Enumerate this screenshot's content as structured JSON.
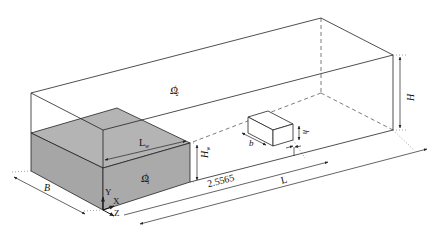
{
  "diagram": {
    "type": "3d-domain-schematic",
    "colors": {
      "line": "#222222",
      "block_fill": "#a9a9a9",
      "block_top": "#b4b4b4",
      "background": "#ffffff"
    },
    "regions": {
      "fluid_upper": {
        "symbol": "Ω",
        "sub": "2",
        "sup": "f"
      },
      "fluid_lower": {
        "symbol": "Ω",
        "sub": "1",
        "sup": "f"
      }
    },
    "dimensions": {
      "width_B": "B",
      "length_L": "L",
      "height_H": "H",
      "wave_length": "L",
      "wave_length_sub": "w",
      "wave_height": "H",
      "wave_height_sub": "w",
      "distance": "2.5565",
      "obstacle_width": "b",
      "obstacle_height": "h"
    },
    "axes": {
      "y": "Y",
      "x": "X",
      "z": "Z"
    }
  }
}
